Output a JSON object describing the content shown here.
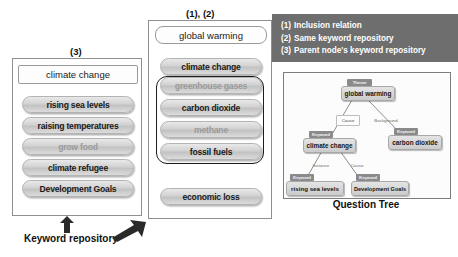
{
  "labels": {
    "left_panel_tag": "(3)",
    "middle_panel_tag": "(1), (2)",
    "keyword_repository": "Keyword repository",
    "tree_caption": "Question Tree"
  },
  "legend": {
    "items": [
      {
        "num": "(1)",
        "text": "Inclusion relation"
      },
      {
        "num": "(2)",
        "text": "Same keyword repository"
      },
      {
        "num": "(3)",
        "text": "Parent node's keyword repository"
      }
    ],
    "background_color": "#6e6e6e",
    "text_color": "#ffffff"
  },
  "left_panel": {
    "header": "climate change",
    "keywords": [
      "rising sea levels",
      "raising temperatures",
      "grow food",
      "climate refugee",
      "Development Goals"
    ]
  },
  "middle_panel": {
    "header": "global warming",
    "top_keyword": "climate change",
    "group": [
      {
        "label": "greenhouse gases",
        "faded": true
      },
      {
        "label": "carbon dioxide",
        "faded": false
      },
      {
        "label": "methane",
        "faded": false
      },
      {
        "label": "fossil fuels",
        "faded": false
      }
    ],
    "bottom_keyword": "economic loss"
  },
  "question_tree": {
    "nodes": [
      {
        "id": "root",
        "chip": "Theme",
        "label": "global warming"
      },
      {
        "id": "climate",
        "chip": "Keyword",
        "label": "climate change"
      },
      {
        "id": "carbon",
        "chip": "Keyword",
        "label": "carbon dioxide"
      },
      {
        "id": "sea",
        "chip": "Keyword",
        "label": "rising sea levels"
      },
      {
        "id": "devgoals",
        "chip": "Keyword",
        "label": "Development Goals"
      }
    ],
    "edges": [
      {
        "from": "root",
        "to": "climate",
        "label": "Cause"
      },
      {
        "from": "root",
        "to": "carbon",
        "label": "Background"
      },
      {
        "from": "climate",
        "to": "sea",
        "label": "Instance"
      },
      {
        "from": "climate",
        "to": "devgoals",
        "label": "Cause"
      }
    ]
  }
}
